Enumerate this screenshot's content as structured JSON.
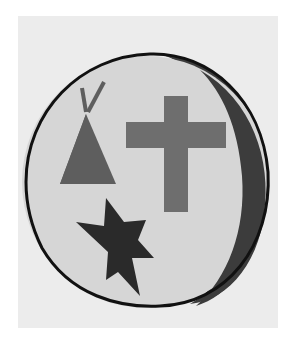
{
  "image": {
    "title": "Emblem with teepee, cross, star and crescent",
    "colors": {
      "page_background": "#ffffff",
      "panel_background": "#ececec",
      "circle_fill": "#d6d6d6",
      "outline": "#111111",
      "crescent": "#3c3c3c",
      "cross": "#6e6e6e",
      "teepee": "#5e5e5e",
      "star": "#2a2a2a"
    },
    "symbols": [
      "teepee-icon",
      "cross-icon",
      "star-icon",
      "crescent-icon"
    ]
  }
}
